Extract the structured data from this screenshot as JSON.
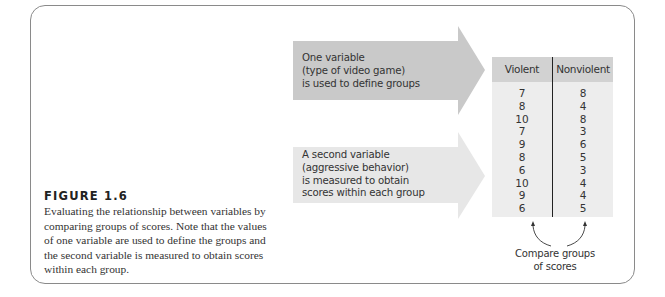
{
  "figure": {
    "label": "FIGURE 1.6",
    "caption_lines": [
      "Evaluating the relationship between variables by",
      "comparing groups of scores. Note that the values",
      "of one variable are used to define the groups and",
      "the second variable is measured to obtain scores",
      "within each group."
    ]
  },
  "arrows": [
    {
      "lines": [
        "One variable",
        "(type of video game)",
        "is used to define groups"
      ],
      "color": "#c9c9c9"
    },
    {
      "lines": [
        "A second variable",
        "(aggressive behavior)",
        "is measured to obtain",
        "scores within each group"
      ],
      "color": "#e7e7e7"
    }
  ],
  "table": {
    "columns": [
      "Violent",
      "Nonviolent"
    ],
    "rows": [
      [
        "7",
        "8"
      ],
      [
        "8",
        "4"
      ],
      [
        "10",
        "8"
      ],
      [
        "7",
        "3"
      ],
      [
        "9",
        "6"
      ],
      [
        "8",
        "5"
      ],
      [
        "6",
        "3"
      ],
      [
        "10",
        "4"
      ],
      [
        "9",
        "4"
      ],
      [
        "6",
        "5"
      ]
    ],
    "header_color": "#d2d2d2",
    "body_color": "#ededed"
  },
  "compare": {
    "lines": [
      "Compare groups",
      "of scores"
    ]
  }
}
